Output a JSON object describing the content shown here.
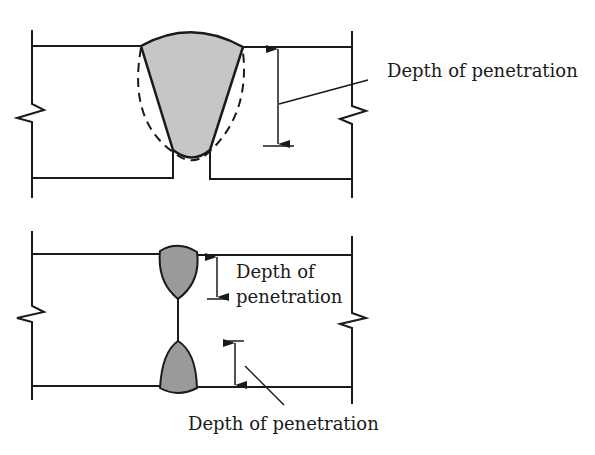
{
  "diagram": {
    "colors": {
      "stroke": "#1a1a1a",
      "weld_fill_top": "#c6c6c6",
      "weld_fill_bottom": "#9a9a9a"
    },
    "top_figure": {
      "title": "Single-V groove weld",
      "label": "Depth of penetration"
    },
    "bottom_figure": {
      "upper_label_line1": "Depth of",
      "upper_label_line2": "penetration",
      "lower_label": "Depth of penetration"
    }
  }
}
